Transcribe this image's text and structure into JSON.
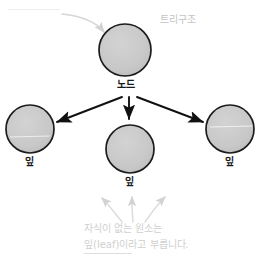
{
  "figure": {
    "title_annotation": "트리구조",
    "top_cutoff_text": "",
    "nodes": [
      {
        "id": "root",
        "label": "노드",
        "cx": 125,
        "cy": 50,
        "r": 26
      },
      {
        "id": "leaf-left",
        "label": "잎",
        "cx": 30,
        "cy": 129,
        "r": 24
      },
      {
        "id": "leaf-middle",
        "label": "잎",
        "cx": 130,
        "cy": 149,
        "r": 24
      },
      {
        "id": "leaf-right",
        "label": "잎",
        "cx": 230,
        "cy": 129,
        "r": 24
      }
    ],
    "edges": [
      {
        "from": "root",
        "to": "leaf-left"
      },
      {
        "from": "root",
        "to": "leaf-middle"
      },
      {
        "from": "root",
        "to": "leaf-right"
      }
    ],
    "caption": {
      "line1": "자식이 없는 원소는",
      "line2": "잎(leaf)이라고 부릅니다.",
      "underlined_term": "잎(leaf)"
    },
    "colors": {
      "node_fill": "#c9c9c9",
      "node_stroke": "#1c1c1c",
      "edge": "#111111",
      "annotation": "#c9c9c9",
      "background": "#ffffff"
    }
  }
}
